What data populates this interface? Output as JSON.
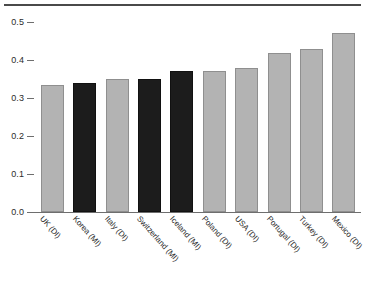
{
  "chart_data": {
    "type": "bar",
    "title": "",
    "xlabel": "",
    "ylabel": "",
    "ylim": [
      0.0,
      0.5
    ],
    "grid": false,
    "legend": "none",
    "ytick_labels": [
      "0.5",
      "0.4",
      "0.3",
      "0.2",
      "0.1",
      "0.0"
    ],
    "ytick_values": [
      0.5,
      0.4,
      0.3,
      0.2,
      0.1,
      0.0
    ],
    "categories": [
      "UK (DI)",
      "Korea (MI)",
      "Italy (DI)",
      "Switzerland (MI)",
      "Iceland (MI)",
      "Poland (DI)",
      "USA (DI)",
      "Portugal (DI)",
      "Turkey (DI)",
      "Mexico (DI)"
    ],
    "values": [
      0.335,
      0.339,
      0.349,
      0.349,
      0.37,
      0.371,
      0.379,
      0.418,
      0.428,
      0.472
    ],
    "bar_styles": [
      "light",
      "dark",
      "light",
      "dark",
      "dark",
      "light",
      "light",
      "light",
      "light",
      "light"
    ],
    "colors": {
      "light_bar": "#b3b3b3",
      "light_bar_border": "#8f8f8f",
      "dark_bar": "#1c1c1c",
      "dark_bar_border": "#111111",
      "axis": "#6e6e6e",
      "rule": "#4a4a4a",
      "text": "#2b2b2b"
    }
  },
  "source_note": ""
}
